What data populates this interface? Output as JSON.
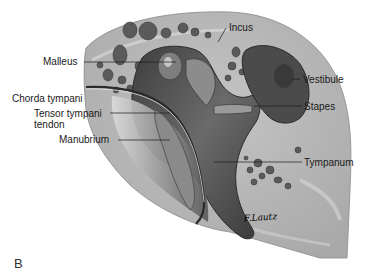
{
  "figure": {
    "panel_letter": "B",
    "signature": "F.Lautz",
    "labels": [
      {
        "id": "incus",
        "text": "Incus"
      },
      {
        "id": "malleus",
        "text": "Malleus"
      },
      {
        "id": "vestibule",
        "text": "Vestibule"
      },
      {
        "id": "chorda-tympani",
        "text": "Chorda tympani"
      },
      {
        "id": "stapes",
        "text": "Stapes"
      },
      {
        "id": "tensor-tympani-tendon-line1",
        "text": "Tensor tympani"
      },
      {
        "id": "tensor-tympani-tendon-line2",
        "text": "tendon"
      },
      {
        "id": "manubrium",
        "text": "Manubrium"
      },
      {
        "id": "tympanum",
        "text": "Tympanum"
      }
    ]
  },
  "colors": {
    "background": "#ffffff",
    "bone": "#b9b9b9",
    "bone_light": "#d2d2d2",
    "cavity_dark": "#4a4a4a",
    "cavity_mid": "#6e6e6e",
    "leader_line": "#1a1a1a",
    "text": "#1a1a1a"
  }
}
